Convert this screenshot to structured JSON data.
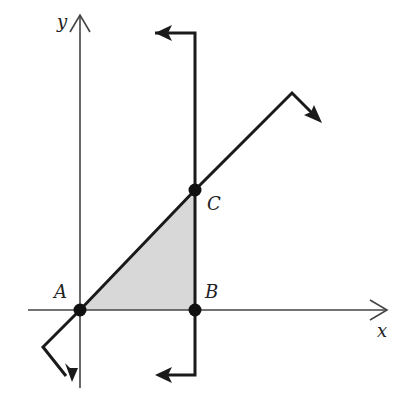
{
  "diagram": {
    "type": "coordinate-geometry",
    "axes": {
      "x_label": "x",
      "y_label": "y"
    },
    "points": [
      {
        "id": "A",
        "label": "A",
        "note": "origin, intersection of diagonal line with axes"
      },
      {
        "id": "B",
        "label": "B",
        "note": "on x-axis, foot of vertical line"
      },
      {
        "id": "C",
        "label": "C",
        "note": "intersection of vertical line and diagonal line"
      }
    ],
    "lines": [
      {
        "id": "vertical-line",
        "through": [
          "B",
          "C"
        ],
        "ends": "hooked arrows pointing left at top and bottom"
      },
      {
        "id": "diagonal-line",
        "through": [
          "A",
          "C"
        ],
        "ends": "hooked arrows at both ends"
      }
    ],
    "shaded_region": {
      "vertices": [
        "A",
        "B",
        "C"
      ],
      "fill": "#d8d8d8"
    },
    "colors": {
      "stroke": "#1a1a1a",
      "axis": "#444444",
      "shade": "#d8d8d8",
      "background": "#ffffff"
    }
  }
}
